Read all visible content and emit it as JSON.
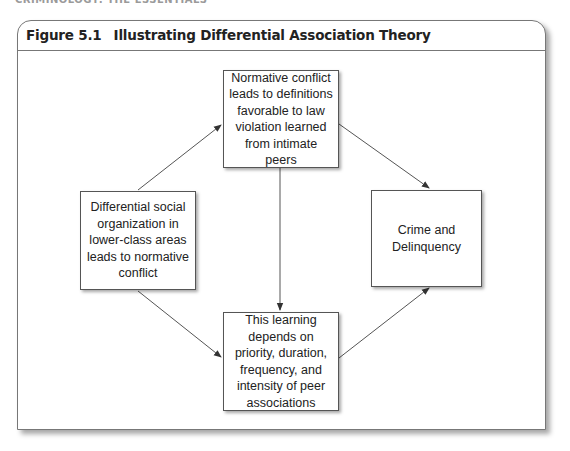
{
  "running_head": "CRIMINOLOGY: THE ESSENTIALS",
  "figure": {
    "number": "Figure 5.1",
    "title": "Illustrating Differential Association Theory"
  },
  "nodes": [
    {
      "id": "left",
      "text": "Differential social organization in lower-class areas leads to normative conflict"
    },
    {
      "id": "top",
      "text": "Normative conflict leads to definitions favorable to law violation learned from intimate peers"
    },
    {
      "id": "bottom",
      "text": "This learning depends on priority, duration, frequency, and intensity of peer associations"
    },
    {
      "id": "right",
      "text": "Crime and Delinquency"
    }
  ],
  "edges": [
    {
      "from": "left",
      "to": "top"
    },
    {
      "from": "top",
      "to": "right"
    },
    {
      "from": "top",
      "to": "bottom"
    },
    {
      "from": "left",
      "to": "bottom"
    },
    {
      "from": "bottom",
      "to": "right"
    }
  ],
  "colors": {
    "line": "#444444",
    "border": "#555555",
    "text": "#222222"
  }
}
